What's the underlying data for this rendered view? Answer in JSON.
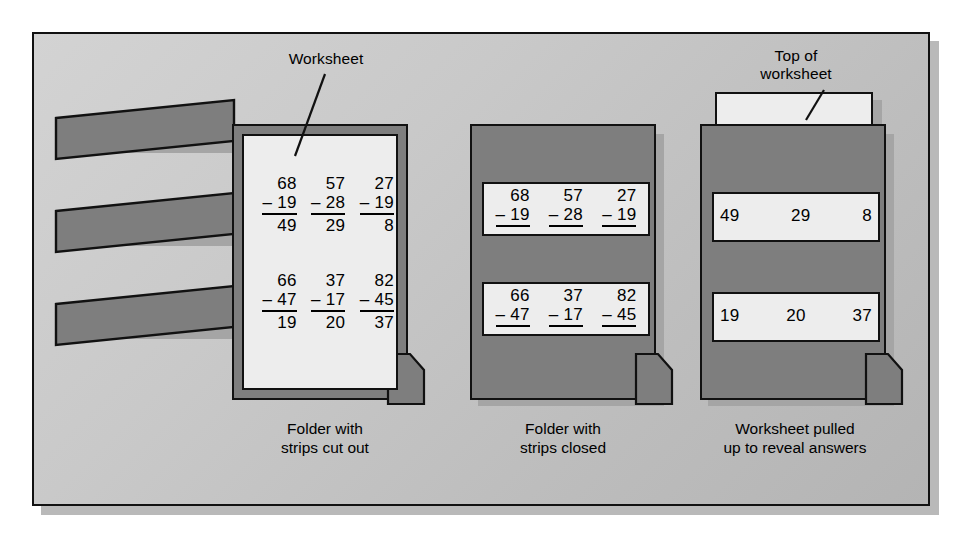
{
  "figure": {
    "background_color": "#c6c6c6",
    "folder_color": "#7e7e7e",
    "paper_color": "#ededed",
    "line_color": "#111111"
  },
  "labels": {
    "worksheet": "Worksheet",
    "top_of_worksheet": "Top of\nworksheet"
  },
  "captions": {
    "left": "Folder with\nstrips cut out",
    "middle": "Folder with\nstrips closed",
    "right": "Worksheet pulled\nup to reveal answers"
  },
  "worksheet": {
    "rows": [
      {
        "problems": [
          {
            "minuend": "68",
            "operator": "–",
            "subtrahend": "19",
            "answer": "49"
          },
          {
            "minuend": "57",
            "operator": "–",
            "subtrahend": "28",
            "answer": "29"
          },
          {
            "minuend": "27",
            "operator": "–",
            "subtrahend": "19",
            "answer": "8"
          }
        ]
      },
      {
        "problems": [
          {
            "minuend": "66",
            "operator": "–",
            "subtrahend": "47",
            "answer": "19"
          },
          {
            "minuend": "37",
            "operator": "–",
            "subtrahend": "17",
            "answer": "20"
          },
          {
            "minuend": "82",
            "operator": "–",
            "subtrahend": "45",
            "answer": "37"
          }
        ]
      }
    ]
  },
  "left_folder": {
    "strip_count": 3,
    "description": "open folder cover with three cut-out strip flaps"
  },
  "middle_folder": {
    "strip_rows": [
      [
        "68 – 19",
        "57 – 28",
        "27 – 19"
      ],
      [
        "66 – 47",
        "37 – 17",
        "82 – 45"
      ]
    ]
  },
  "right_folder": {
    "answer_rows": [
      [
        "49",
        "29",
        "8"
      ],
      [
        "19",
        "20",
        "37"
      ]
    ]
  }
}
